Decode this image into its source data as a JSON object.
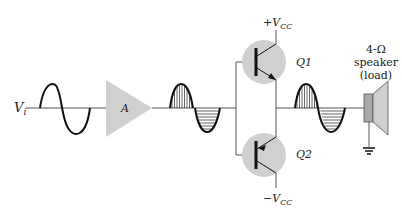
{
  "diagram": {
    "input_label": "V",
    "input_sub": "i",
    "amplifier_label": "A",
    "transistors": [
      {
        "name": "Q1",
        "supply_sign": "+",
        "supply": "V",
        "supply_sub": "CC"
      },
      {
        "name": "Q2",
        "supply_sign": "−",
        "supply": "V",
        "supply_sub": "CC"
      }
    ],
    "load": {
      "line1": "4-Ω",
      "line2": "speaker",
      "line3": "(load)"
    },
    "colors": {
      "shade": "#d0d0d0",
      "speaker_body": "#a8a8a8",
      "wire": "#555555",
      "wave": "#111111"
    }
  }
}
